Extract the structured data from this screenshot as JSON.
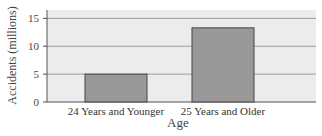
{
  "chart_data": {
    "type": "bar",
    "title": "",
    "xlabel": "Age",
    "ylabel": "Accidents (millions)",
    "categories": [
      "24 Years and Younger",
      "25 Years and Older"
    ],
    "values": [
      5,
      13.3
    ],
    "ylim": [
      0,
      16.5
    ],
    "yticks": [
      0,
      5,
      10,
      15
    ],
    "grid": true,
    "legend": null,
    "colors": {
      "bar": "#999999",
      "bar_border": "#444444",
      "plot_bg": "#ececec",
      "grid": "#888888"
    }
  }
}
